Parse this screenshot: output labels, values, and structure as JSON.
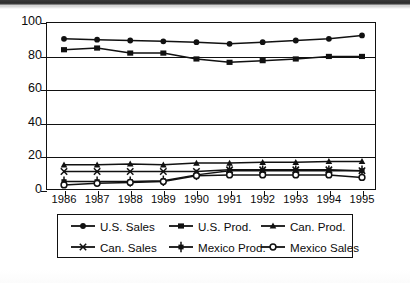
{
  "chart_data": {
    "type": "line",
    "title": "",
    "xlabel": "",
    "ylabel": "",
    "ylim": [
      0,
      100
    ],
    "yticks": [
      0,
      20,
      40,
      60,
      80,
      100
    ],
    "grid": true,
    "legend_position": "bottom",
    "categories": [
      "1986",
      "1987",
      "1988",
      "1989",
      "1990",
      "1991",
      "1992",
      "1993",
      "1994",
      "1995"
    ],
    "series": [
      {
        "name": "U.S. Sales",
        "marker": "filled-circle",
        "values": [
          90,
          89.5,
          89,
          88.5,
          88,
          87,
          88,
          89,
          90,
          92
        ]
      },
      {
        "name": "U.S. Prod.",
        "marker": "filled-square",
        "values": [
          83.5,
          84.5,
          81.5,
          81.5,
          78,
          76,
          77,
          78,
          79.5,
          79.5
        ]
      },
      {
        "name": "Can. Prod.",
        "marker": "filled-triangle",
        "values": [
          15,
          15,
          15.5,
          15,
          16,
          16,
          16.5,
          16.5,
          17,
          17
        ]
      },
      {
        "name": "Can. Sales",
        "marker": "cross-x",
        "values": [
          11,
          11,
          11,
          11,
          11,
          12,
          12,
          12,
          12,
          11.5
        ]
      },
      {
        "name": "Mexico Prod.",
        "marker": "barred-square",
        "values": [
          5,
          5,
          5,
          5.5,
          9,
          11.5,
          11.5,
          11.5,
          11.5,
          11.5
        ]
      },
      {
        "name": "Mexico Sales",
        "marker": "open-circle",
        "values": [
          3,
          4,
          4.5,
          5,
          8.5,
          9,
          9,
          9,
          9,
          7.5
        ]
      }
    ]
  },
  "axis": {
    "y_labels": [
      "100",
      "80",
      "60",
      "40",
      "20",
      "0"
    ],
    "x_labels": [
      "1986",
      "1987",
      "1988",
      "1989",
      "1990",
      "1991",
      "1992",
      "1993",
      "1994",
      "1995"
    ]
  },
  "legend": {
    "rows": [
      [
        {
          "label": "U.S. Sales",
          "marker": "filled-circle"
        },
        {
          "label": "U.S. Prod.",
          "marker": "filled-square"
        },
        {
          "label": "Can. Prod.",
          "marker": "filled-triangle"
        }
      ],
      [
        {
          "label": "Can. Sales",
          "marker": "cross-x"
        },
        {
          "label": "Mexico Prod.",
          "marker": "barred-square"
        },
        {
          "label": "Mexico Sales",
          "marker": "open-circle"
        }
      ]
    ]
  },
  "colors": {
    "ink": "#111111",
    "background": "#ffffff"
  }
}
